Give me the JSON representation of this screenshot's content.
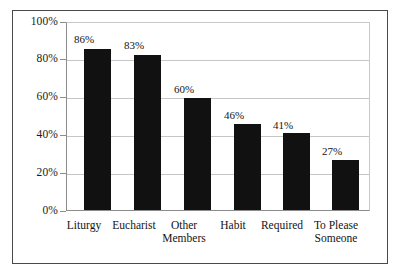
{
  "chart_data": {
    "type": "bar",
    "title": "",
    "subtitle": "",
    "xlabel": "",
    "ylabel": "",
    "categories": [
      "Liturgy",
      "Eucharist",
      "Other\nMembers",
      "Habit",
      "Required",
      "To Please\nSomeone"
    ],
    "values": [
      86,
      83,
      60,
      46,
      41,
      27
    ],
    "value_labels": [
      "86%",
      "83%",
      "60%",
      "46%",
      "41%",
      "27%"
    ],
    "ylim": [
      0,
      100
    ],
    "yticks": [
      100,
      80,
      60,
      40,
      20,
      0
    ],
    "ytick_labels": [
      "100%",
      "80%",
      "60%",
      "40%",
      "20%",
      "0%"
    ],
    "grid": true,
    "grid_axis": "y",
    "legend": null,
    "legend_position": "none",
    "bar_color": "#111111",
    "grid_color": "#c6c6c6",
    "axis_color": "#8c8c8c",
    "frame_color": "#4a4a4a",
    "background": "#ffffff",
    "text_color": "#141414"
  }
}
